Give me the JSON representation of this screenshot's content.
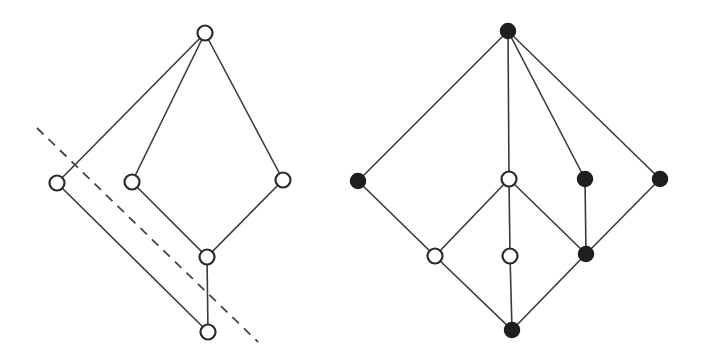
{
  "diagrams": [
    {
      "id": "left-lattice",
      "nodes": [
        {
          "id": "top",
          "x": 205,
          "y": 33,
          "filled": false
        },
        {
          "id": "a",
          "x": 57,
          "y": 183,
          "filled": false
        },
        {
          "id": "b",
          "x": 132,
          "y": 182,
          "filled": false
        },
        {
          "id": "c",
          "x": 283,
          "y": 180,
          "filled": false
        },
        {
          "id": "d",
          "x": 207,
          "y": 257,
          "filled": false
        },
        {
          "id": "bottom",
          "x": 208,
          "y": 332,
          "filled": false
        }
      ],
      "edges": [
        [
          "top",
          "a"
        ],
        [
          "top",
          "b"
        ],
        [
          "top",
          "c"
        ],
        [
          "a",
          "bottom"
        ],
        [
          "b",
          "d"
        ],
        [
          "c",
          "d"
        ],
        [
          "d",
          "bottom"
        ]
      ],
      "dashed_line": {
        "x1": 37,
        "y1": 128,
        "x2": 258,
        "y2": 342
      }
    },
    {
      "id": "right-lattice",
      "nodes": [
        {
          "id": "top",
          "x": 508,
          "y": 31,
          "filled": true
        },
        {
          "id": "p",
          "x": 358,
          "y": 181,
          "filled": true
        },
        {
          "id": "q",
          "x": 509,
          "y": 179,
          "filled": false
        },
        {
          "id": "r",
          "x": 585,
          "y": 179,
          "filled": true
        },
        {
          "id": "s",
          "x": 660,
          "y": 179,
          "filled": true
        },
        {
          "id": "t",
          "x": 435,
          "y": 256,
          "filled": false
        },
        {
          "id": "u",
          "x": 510,
          "y": 256,
          "filled": false
        },
        {
          "id": "v",
          "x": 586,
          "y": 254,
          "filled": true
        },
        {
          "id": "bottom",
          "x": 512,
          "y": 330,
          "filled": true
        }
      ],
      "edges": [
        [
          "top",
          "p"
        ],
        [
          "top",
          "q"
        ],
        [
          "top",
          "r"
        ],
        [
          "top",
          "s"
        ],
        [
          "p",
          "t"
        ],
        [
          "q",
          "t"
        ],
        [
          "q",
          "u"
        ],
        [
          "q",
          "v"
        ],
        [
          "r",
          "v"
        ],
        [
          "s",
          "v"
        ],
        [
          "t",
          "bottom"
        ],
        [
          "u",
          "bottom"
        ],
        [
          "v",
          "bottom"
        ]
      ]
    }
  ],
  "node_radius": 7.5
}
